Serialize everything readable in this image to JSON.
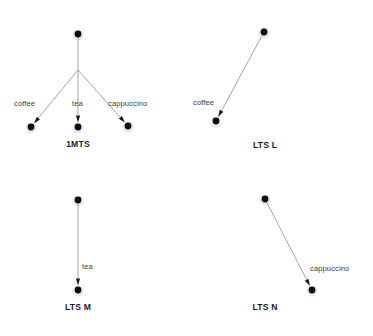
{
  "figure": {
    "background_color": "#ffffff",
    "node_color": "#0d0d0d",
    "edge_color": "#9a9a9a",
    "label_color": "#3d3d3d",
    "title_color": "#1c1c1c"
  },
  "diagrams": [
    {
      "id": "1mts",
      "title": "1MTS",
      "title_x": 78,
      "title_y": 140,
      "nodes": [
        {
          "name": "root",
          "x": 78,
          "y": 34
        },
        {
          "name": "leaf-coffee",
          "x": 31,
          "y": 127
        },
        {
          "name": "leaf-tea",
          "x": 78,
          "y": 127
        },
        {
          "name": "leaf-cappuccino",
          "x": 128,
          "y": 126
        }
      ],
      "branch_point": {
        "x": 78,
        "y": 70
      },
      "edges": [
        {
          "label": "coffee",
          "from": "root",
          "to": "leaf-coffee",
          "x1": 78,
          "y1": 70,
          "x2": 31,
          "y2": 127,
          "label_x": 14,
          "label_y": 100
        },
        {
          "label": "tea",
          "from": "root",
          "to": "leaf-tea",
          "x1": 78,
          "y1": 70,
          "x2": 78,
          "y2": 127,
          "label_x": 72,
          "label_y": 100
        },
        {
          "label": "cappuccino",
          "from": "root",
          "to": "leaf-cappuccino",
          "x1": 78,
          "y1": 70,
          "x2": 128,
          "y2": 126,
          "label_x": 108,
          "label_y": 100
        }
      ]
    },
    {
      "id": "lts-l",
      "title": "LTS L",
      "title_x": 265,
      "title_y": 141,
      "nodes": [
        {
          "name": "root",
          "x": 264,
          "y": 32
        },
        {
          "name": "leaf-coffee",
          "x": 216,
          "y": 121
        }
      ],
      "edges": [
        {
          "label": "coffee",
          "from": "root",
          "to": "leaf-coffee",
          "x1": 264,
          "y1": 32,
          "x2": 216,
          "y2": 121,
          "label_x": 193,
          "label_y": 99
        }
      ]
    },
    {
      "id": "lts-m",
      "title": "LTS M",
      "title_x": 78,
      "title_y": 303,
      "nodes": [
        {
          "name": "root",
          "x": 78,
          "y": 200
        },
        {
          "name": "leaf-tea",
          "x": 78,
          "y": 290
        }
      ],
      "edges": [
        {
          "label": "tea",
          "from": "root",
          "to": "leaf-tea",
          "x1": 78,
          "y1": 200,
          "x2": 78,
          "y2": 290,
          "label_x": 82,
          "label_y": 263
        }
      ]
    },
    {
      "id": "lts-n",
      "title": "LTS N",
      "title_x": 265,
      "title_y": 303,
      "nodes": [
        {
          "name": "root",
          "x": 265,
          "y": 199
        },
        {
          "name": "leaf-cappuccino",
          "x": 312,
          "y": 290
        }
      ],
      "edges": [
        {
          "label": "cappuccino",
          "from": "root",
          "to": "leaf-cappuccino",
          "x1": 265,
          "y1": 199,
          "x2": 312,
          "y2": 290,
          "label_x": 310,
          "label_y": 265
        }
      ]
    }
  ]
}
